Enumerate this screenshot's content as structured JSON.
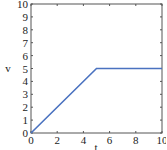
{
  "chart_data": {
    "type": "line",
    "title": "",
    "xlabel": "t",
    "ylabel": "v",
    "xlim": [
      0,
      10
    ],
    "ylim": [
      0,
      10
    ],
    "xticks": [
      0,
      2,
      4,
      6,
      8,
      10
    ],
    "yticks": [
      0,
      1,
      2,
      3,
      4,
      5,
      6,
      7,
      8,
      9,
      10
    ],
    "grid": false,
    "legend": null,
    "series": [
      {
        "name": "v",
        "color": "#4a72c0",
        "x": [
          0,
          5,
          10
        ],
        "y": [
          0,
          5,
          5
        ]
      }
    ]
  },
  "colors": {
    "line": "#4a72c0",
    "axes": "#555555",
    "background": "#ffffff"
  }
}
